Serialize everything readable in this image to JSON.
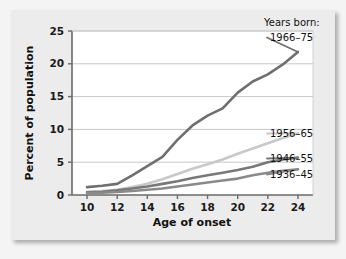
{
  "figure": {
    "background_color": "#f4f4f4",
    "card_color": "#ececec",
    "plot_background_color": "#ffffff"
  },
  "chart_data": {
    "type": "line",
    "title": "",
    "xlabel": "Age of onset",
    "ylabel": "Percent of population",
    "xlim": [
      9,
      25
    ],
    "ylim": [
      0,
      25
    ],
    "xticks": [
      10,
      12,
      14,
      16,
      18,
      20,
      22,
      24
    ],
    "xtick_labels": [
      "10",
      "12",
      "14",
      "16",
      "18",
      "20",
      "22",
      "24"
    ],
    "yticks": [
      0,
      5,
      10,
      15,
      20,
      25
    ],
    "ytick_labels": [
      "0",
      "5",
      "10",
      "15",
      "20",
      "25"
    ],
    "grid": "horizontal",
    "legend_position": "right-inline",
    "legend_title": "Years born:",
    "x": [
      10,
      11,
      12,
      13,
      14,
      15,
      16,
      17,
      18,
      19,
      20,
      21,
      22,
      23,
      24
    ],
    "series": [
      {
        "name": "1966-75",
        "label": "1966–75",
        "color": "#6f6f6f",
        "width": 2.6,
        "values": [
          1.2,
          1.4,
          1.7,
          3.0,
          4.4,
          5.8,
          8.4,
          10.6,
          12.1,
          13.2,
          15.6,
          17.3,
          18.4,
          19.9,
          21.8
        ]
      },
      {
        "name": "1956-65",
        "label": "1956–65",
        "color": "#c8c8c8",
        "width": 2.6,
        "values": [
          0.5,
          0.6,
          0.8,
          1.2,
          1.7,
          2.4,
          3.2,
          4.0,
          4.7,
          5.4,
          6.3,
          7.1,
          7.9,
          8.7,
          9.4
        ]
      },
      {
        "name": "1946-55",
        "label": "1946–55",
        "color": "#787878",
        "width": 2.6,
        "values": [
          0.4,
          0.5,
          0.7,
          1.0,
          1.3,
          1.7,
          2.1,
          2.6,
          3.0,
          3.4,
          3.8,
          4.3,
          5.0,
          5.4,
          5.7
        ]
      },
      {
        "name": "1936-45",
        "label": "1936–45",
        "color": "#8a8a8a",
        "width": 2.6,
        "values": [
          0.3,
          0.35,
          0.45,
          0.6,
          0.8,
          1.0,
          1.3,
          1.6,
          1.9,
          2.2,
          2.5,
          3.0,
          3.4,
          3.7,
          3.9
        ]
      }
    ],
    "series_labels": [
      "1966–75",
      "1956–65",
      "1946–55",
      "1936–45"
    ]
  }
}
